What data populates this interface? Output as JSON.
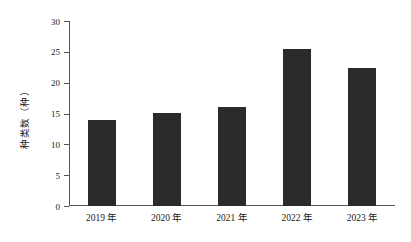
{
  "chart_data": {
    "type": "bar",
    "title": "",
    "subtitle": "",
    "xlabel": "",
    "ylabel": "种类数（种）",
    "categories": [
      "2019 年",
      "2020 年",
      "2021 年",
      "2022 年",
      "2023 年"
    ],
    "values": [
      13.9,
      15.1,
      16.0,
      25.4,
      22.4
    ],
    "series": [
      {
        "name": "种类数",
        "values": [
          13.9,
          15.1,
          16.0,
          25.4,
          22.4
        ]
      }
    ],
    "ylim": [
      0,
      30
    ],
    "ytick_labels": [
      "0",
      "5",
      "10",
      "15",
      "20",
      "25",
      "30"
    ],
    "ytick_values": [
      0,
      5,
      10,
      15,
      20,
      25,
      30
    ],
    "grid": false,
    "legend": false,
    "legend_position": "none",
    "bar_color": "#2b2b2b",
    "axis_color": "#555555",
    "background_color": "#ffffff",
    "annotations": []
  },
  "axes": {
    "y": {
      "label": "种类数（种）",
      "min": 0,
      "max": 30,
      "tick_step": 5,
      "ticks": [
        {
          "value": 30,
          "label": "30"
        },
        {
          "value": 25,
          "label": "25"
        },
        {
          "value": 20,
          "label": "20"
        },
        {
          "value": 15,
          "label": "15"
        },
        {
          "value": 10,
          "label": "10"
        },
        {
          "value": 5,
          "label": "5"
        },
        {
          "value": 0,
          "label": "0"
        }
      ]
    },
    "x": {
      "label": "",
      "ticks": [
        {
          "label": "2019 年"
        },
        {
          "label": "2020 年"
        },
        {
          "label": "2021 年"
        },
        {
          "label": "2022 年"
        },
        {
          "label": "2023 年"
        }
      ]
    }
  },
  "bars": [
    {
      "category": "2019 年",
      "value": 13.9
    },
    {
      "category": "2020 年",
      "value": 15.1
    },
    {
      "category": "2021 年",
      "value": 16.0
    },
    {
      "category": "2022 年",
      "value": 25.4
    },
    {
      "category": "2023 年",
      "value": 22.4
    }
  ]
}
